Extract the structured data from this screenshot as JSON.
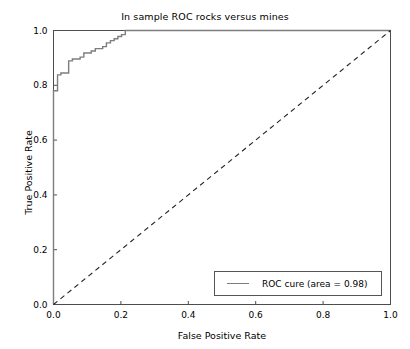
{
  "chart_data": {
    "type": "line",
    "title": "In sample ROC rocks versus mines",
    "xlabel": "False Positive Rate",
    "ylabel": "True Positive Rate",
    "xlim": [
      0.0,
      1.0
    ],
    "ylim": [
      0.0,
      1.0
    ],
    "xticks": [
      "0.0",
      "0.2",
      "0.4",
      "0.6",
      "0.8",
      "1.0"
    ],
    "xtick_values": [
      0.0,
      0.2,
      0.4,
      0.6,
      0.8,
      1.0
    ],
    "yticks": [
      "0.0",
      "0.2",
      "0.4",
      "0.6",
      "0.8",
      "1.0"
    ],
    "ytick_values": [
      0.0,
      0.2,
      0.4,
      0.6,
      0.8,
      1.0
    ],
    "grid": false,
    "legend_position": "lower right",
    "series": [
      {
        "name": "ROC cure (area = 0.98)",
        "type": "step",
        "color": "#7d7d7d",
        "linestyle": "solid",
        "area": 0.98,
        "x": [
          0.0,
          0.0,
          0.012,
          0.012,
          0.022,
          0.022,
          0.045,
          0.045,
          0.056,
          0.056,
          0.079,
          0.079,
          0.09,
          0.09,
          0.112,
          0.112,
          0.124,
          0.124,
          0.146,
          0.146,
          0.157,
          0.157,
          0.169,
          0.169,
          0.18,
          0.18,
          0.191,
          0.191,
          0.202,
          0.202,
          0.213,
          0.213,
          0.225,
          1.0
        ],
        "y": [
          0.0,
          0.78,
          0.78,
          0.838,
          0.838,
          0.845,
          0.845,
          0.889,
          0.889,
          0.896,
          0.896,
          0.903,
          0.903,
          0.918,
          0.918,
          0.925,
          0.925,
          0.934,
          0.934,
          0.941,
          0.941,
          0.955,
          0.955,
          0.963,
          0.963,
          0.97,
          0.97,
          0.978,
          0.978,
          0.985,
          0.985,
          1.0,
          1.0,
          1.0
        ]
      },
      {
        "name": "chance-diagonal",
        "type": "line",
        "color": "#222222",
        "linestyle": "dashed",
        "x": [
          0.0,
          1.0
        ],
        "y": [
          0.0,
          1.0
        ]
      }
    ],
    "annotations": []
  },
  "legend": {
    "entries": [
      {
        "label": "ROC cure (area = 0.98)",
        "color": "#7d7d7d"
      }
    ]
  },
  "axes": {
    "spine_color": "#4d4d4d"
  }
}
